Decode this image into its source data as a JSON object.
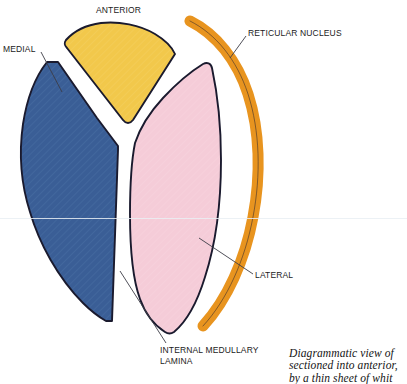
{
  "figure": {
    "labels": {
      "anterior": "ANTERIOR",
      "medial": "MEDIAL",
      "reticular": "RETICULAR NUCLEUS",
      "lateral": "LATERAL",
      "internal_medullary_lamina": "INTERNAL MEDULLARY LAMINA"
    },
    "caption": {
      "line1": "Diagrammatic view of",
      "line2": "sectioned into anterior,",
      "line3": "by a thin sheet of whit"
    },
    "colors": {
      "medial_fill": "#3a5e96",
      "anterior_fill": "#f2c84b",
      "lateral_fill": "#f5ccd8",
      "reticular_fill": "#e8941f",
      "outline": "#1a1a2e",
      "lamina": "#ffffff",
      "leader_line": "#3c3c46",
      "text": "#1b1b1b"
    }
  }
}
